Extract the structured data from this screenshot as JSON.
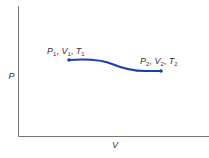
{
  "diagram": {
    "type": "pv-process",
    "axes": {
      "x_label": "V",
      "y_label": "P",
      "color": "#777777"
    },
    "curve": {
      "color": "#1e3fa8",
      "start": {
        "label_P": "P",
        "label_V": "V",
        "label_T": "T",
        "subscript": "1"
      },
      "end": {
        "label_P": "P",
        "label_V": "V",
        "label_T": "T",
        "subscript": "2"
      }
    }
  }
}
